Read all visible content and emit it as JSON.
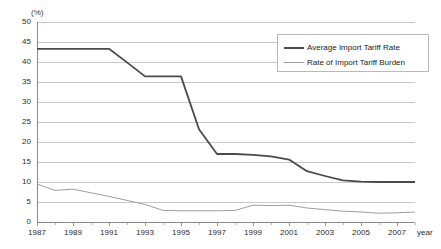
{
  "chart_data": {
    "type": "line",
    "title": "",
    "xlabel": "year",
    "ylabel": "",
    "unit_label": "(%)",
    "ylim": [
      0,
      50
    ],
    "ytick_step": 5,
    "yticks": [
      0,
      5,
      10,
      15,
      20,
      25,
      30,
      35,
      40,
      45,
      50
    ],
    "grid": true,
    "legend_position": "top-right",
    "x": [
      1987,
      1988,
      1989,
      1990,
      1991,
      1992,
      1993,
      1994,
      1995,
      1996,
      1997,
      1998,
      1999,
      2000,
      2001,
      2002,
      2003,
      2004,
      2005,
      2006,
      2007,
      2008
    ],
    "xtick_labels": [
      "1987",
      "1989",
      "1991",
      "1993",
      "1995",
      "1997",
      "1999",
      "2001",
      "2003",
      "2005",
      "2007"
    ],
    "series": [
      {
        "name": "Average Import Tariff Rate",
        "color": "#4a4a4a",
        "width": 1.8,
        "values": [
          43.3,
          43.3,
          43.3,
          43.3,
          43.3,
          39.9,
          36.4,
          36.4,
          36.4,
          23.2,
          17.0,
          17.0,
          16.8,
          16.4,
          15.6,
          12.7,
          11.5,
          10.4,
          10.1,
          10.0,
          10.0,
          10.0
        ]
      },
      {
        "name": "Rate of Import Tariff Burden",
        "color": "#9e9e9e",
        "width": 1.0,
        "values": [
          9.5,
          7.9,
          8.2,
          7.3,
          6.4,
          5.4,
          4.4,
          2.9,
          2.8,
          2.8,
          2.8,
          2.9,
          4.2,
          4.1,
          4.2,
          3.5,
          3.1,
          2.7,
          2.5,
          2.2,
          2.3,
          2.5
        ]
      }
    ]
  },
  "legend": {
    "items": [
      {
        "label": "Average Import Tariff Rate"
      },
      {
        "label": "Rate of Import Tariff Burden"
      }
    ]
  }
}
